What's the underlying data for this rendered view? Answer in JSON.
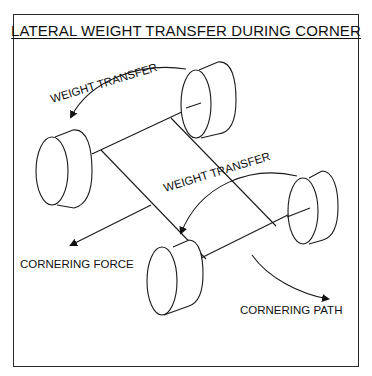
{
  "diagram": {
    "title": "LATERAL WEIGHT TRANSFER DURING CORNER",
    "labels": {
      "weight_transfer_top": "WEIGHT TRANSFER",
      "weight_transfer_middle": "WEIGHT TRANSFER",
      "cornering_force": "CORNERING FORCE",
      "cornering_path": "CORNERING PATH"
    },
    "components": [
      "left-front-wheel",
      "right-front-wheel",
      "left-rear-wheel",
      "right-rear-wheel",
      "front-axle",
      "rear-axle",
      "chassis-frame"
    ],
    "colors": {
      "line": "#1a1a1a",
      "background": "#ffffff"
    }
  }
}
